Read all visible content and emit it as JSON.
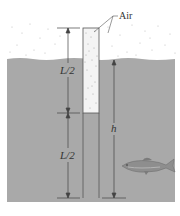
{
  "diagram": {
    "labels": {
      "air": "Air",
      "upper_half": "L/2",
      "lower_half": "L/2",
      "depth": "h"
    },
    "regions": {
      "air_region": "air",
      "water_region": "water",
      "tube_air_column": "air inside tube",
      "tube_water_column": "water inside tube"
    },
    "icons": {
      "fish": "fish-icon"
    },
    "colors": {
      "water": "#a9a9a9",
      "air_background": "#ffffff",
      "air_dots": "#b8b8b8",
      "tube_air": "#f4f4f4",
      "lines": "#444444"
    }
  }
}
